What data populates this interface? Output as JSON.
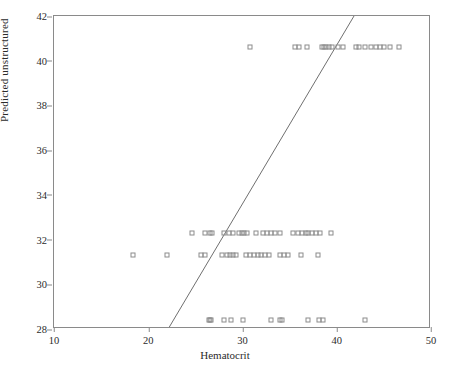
{
  "chart_data": {
    "type": "scatter",
    "title": "",
    "xlabel": "Hematocrit",
    "ylabel": "Predicted unstructured",
    "xlim": [
      10,
      50
    ],
    "ylim": [
      28,
      42
    ],
    "xticks": [
      10,
      20,
      30,
      40,
      50
    ],
    "yticks": [
      28,
      30,
      32,
      34,
      36,
      38,
      40,
      42
    ],
    "grid": false,
    "legend": null,
    "marker": "open-square",
    "marker_color": "#8c8c8c",
    "reference_line": {
      "label": "identity line y = x",
      "x0": 22.3,
      "y0": 28.0,
      "x1": 42.0,
      "y1": 42.0,
      "color": "#6e6e6e"
    },
    "series": [
      {
        "name": "Predicted unstructured vs Hematocrit",
        "points": [
          [
            30.8,
            40.6
          ],
          [
            35.6,
            40.6
          ],
          [
            36.0,
            40.6
          ],
          [
            36.8,
            40.6
          ],
          [
            38.4,
            40.6
          ],
          [
            38.7,
            40.6
          ],
          [
            38.9,
            40.6
          ],
          [
            39.2,
            40.6
          ],
          [
            39.5,
            40.6
          ],
          [
            40.1,
            40.6
          ],
          [
            40.7,
            40.6
          ],
          [
            42.0,
            40.6
          ],
          [
            42.4,
            40.6
          ],
          [
            43.0,
            40.6
          ],
          [
            43.6,
            40.6
          ],
          [
            44.2,
            40.6
          ],
          [
            44.6,
            40.6
          ],
          [
            45.0,
            40.6
          ],
          [
            45.7,
            40.6
          ],
          [
            46.6,
            40.6
          ],
          [
            24.6,
            32.3
          ],
          [
            26.0,
            32.3
          ],
          [
            26.6,
            32.3
          ],
          [
            26.8,
            32.3
          ],
          [
            28.0,
            32.3
          ],
          [
            28.6,
            32.3
          ],
          [
            29.0,
            32.3
          ],
          [
            29.6,
            32.3
          ],
          [
            29.9,
            32.3
          ],
          [
            30.2,
            32.3
          ],
          [
            30.5,
            32.3
          ],
          [
            31.4,
            32.3
          ],
          [
            32.2,
            32.3
          ],
          [
            32.6,
            32.3
          ],
          [
            33.0,
            32.3
          ],
          [
            33.4,
            32.3
          ],
          [
            34.0,
            32.3
          ],
          [
            35.4,
            32.3
          ],
          [
            35.9,
            32.3
          ],
          [
            36.3,
            32.3
          ],
          [
            36.7,
            32.3
          ],
          [
            37.0,
            32.3
          ],
          [
            37.4,
            32.3
          ],
          [
            37.8,
            32.3
          ],
          [
            38.2,
            32.3
          ],
          [
            39.4,
            32.3
          ],
          [
            18.4,
            31.3
          ],
          [
            22.0,
            31.3
          ],
          [
            25.6,
            31.3
          ],
          [
            26.0,
            31.3
          ],
          [
            27.8,
            31.3
          ],
          [
            28.4,
            31.3
          ],
          [
            28.7,
            31.3
          ],
          [
            29.0,
            31.3
          ],
          [
            29.3,
            31.3
          ],
          [
            30.4,
            31.3
          ],
          [
            30.8,
            31.3
          ],
          [
            31.2,
            31.3
          ],
          [
            31.6,
            31.3
          ],
          [
            32.0,
            31.3
          ],
          [
            32.4,
            31.3
          ],
          [
            32.8,
            31.3
          ],
          [
            34.0,
            31.3
          ],
          [
            34.4,
            31.3
          ],
          [
            34.8,
            31.3
          ],
          [
            36.2,
            31.3
          ],
          [
            38.0,
            31.3
          ],
          [
            26.4,
            28.4
          ],
          [
            26.6,
            28.4
          ],
          [
            26.7,
            28.4
          ],
          [
            28.0,
            28.4
          ],
          [
            28.8,
            28.4
          ],
          [
            30.0,
            28.4
          ],
          [
            33.0,
            28.4
          ],
          [
            34.0,
            28.4
          ],
          [
            34.2,
            28.4
          ],
          [
            37.0,
            28.4
          ],
          [
            38.1,
            28.4
          ],
          [
            38.5,
            28.4
          ],
          [
            43.0,
            28.4
          ]
        ]
      }
    ]
  }
}
